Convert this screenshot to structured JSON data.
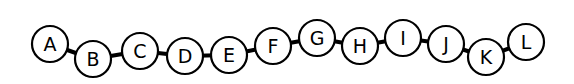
{
  "diagram": {
    "type": "bead-chain",
    "radius": 18,
    "nodes": [
      {
        "label": "A",
        "x": 50,
        "y": 44
      },
      {
        "label": "B",
        "x": 93,
        "y": 59
      },
      {
        "label": "C",
        "x": 140,
        "y": 51
      },
      {
        "label": "D",
        "x": 185,
        "y": 56
      },
      {
        "label": "E",
        "x": 229,
        "y": 55
      },
      {
        "label": "F",
        "x": 273,
        "y": 46
      },
      {
        "label": "G",
        "x": 317,
        "y": 38
      },
      {
        "label": "H",
        "x": 360,
        "y": 46
      },
      {
        "label": "I",
        "x": 403,
        "y": 38
      },
      {
        "label": "J",
        "x": 446,
        "y": 44
      },
      {
        "label": "K",
        "x": 486,
        "y": 57
      },
      {
        "label": "L",
        "x": 526,
        "y": 42
      }
    ]
  }
}
